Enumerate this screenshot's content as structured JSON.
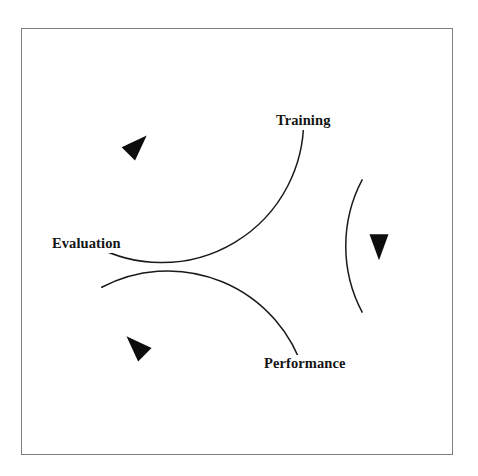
{
  "diagram": {
    "type": "cycle",
    "title": "",
    "direction": "clockwise",
    "background_color": "#ffffff",
    "frame": {
      "name": "page-frame",
      "border_color": "#7e7e80",
      "border_width_px": 1
    },
    "circle": {
      "center_x": 237,
      "center_y": 246,
      "radius": 142,
      "stroke_color": "#1a1a1a",
      "stroke_width": 1.5
    },
    "nodes": [
      {
        "id": "training",
        "label": "Training",
        "angle_deg": 45,
        "position": "upper-right"
      },
      {
        "id": "performance",
        "label": "Performance",
        "angle_deg": -45,
        "position": "lower-right"
      },
      {
        "id": "evaluation",
        "label": "Evaluation",
        "angle_deg": 180,
        "position": "left"
      }
    ],
    "arrows": [
      {
        "id": "training-to-performance",
        "from": "training",
        "to": "performance",
        "head_position": "right",
        "head_direction": "down",
        "color": "#0d0d0d"
      },
      {
        "id": "performance-to-evaluation",
        "from": "performance",
        "to": "evaluation",
        "head_position": "lower-left",
        "head_direction": "up-left",
        "color": "#0d0d0d"
      },
      {
        "id": "evaluation-to-training",
        "from": "evaluation",
        "to": "training",
        "head_position": "upper-left",
        "head_direction": "up-right",
        "color": "#0d0d0d"
      }
    ]
  }
}
